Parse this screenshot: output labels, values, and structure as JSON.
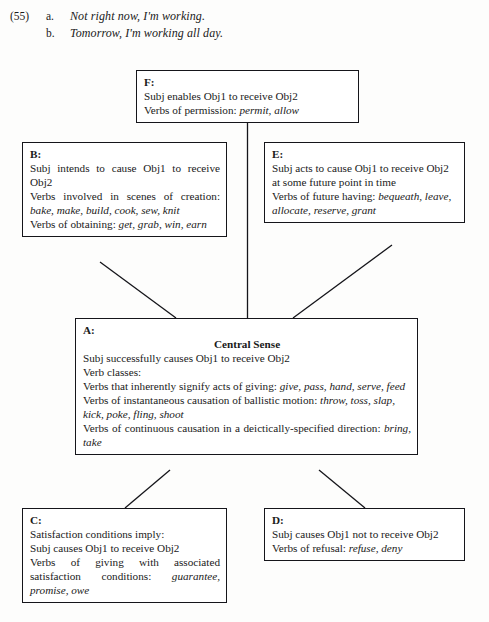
{
  "examples": {
    "number": "(55)",
    "items": [
      {
        "letter": "a.",
        "text": "Not right now, I'm working."
      },
      {
        "letter": "b.",
        "text": "Tomorrow, I'm working all day."
      }
    ]
  },
  "diagram": {
    "colors": {
      "line": "#15151a",
      "box_fill": "#ffffff",
      "page_bg": "#fdfdfc"
    },
    "nodes": {
      "F": {
        "label": "F:",
        "lines": [
          "Subj enables Obj1 to receive Obj2",
          "Verbs of permission: permit, allow"
        ],
        "line1": "Subj enables Obj1 to receive Obj2",
        "line2_pre": "Verbs of permission: ",
        "line2_italic": "permit, allow"
      },
      "B": {
        "label": "B:",
        "line1": "Subj intends to cause Obj1 to receive Obj2",
        "line2_pre": "Verbs involved in scenes of creation: ",
        "line2_italic": "bake, make, build, cook, sew, knit",
        "line3_pre": "Verbs of obtaining: ",
        "line3_italic": "get, grab, win, earn"
      },
      "E": {
        "label": "E:",
        "line1": "Subj acts to cause Obj1 to receive Obj2 at some future point in time",
        "line2_pre": "Verbs of future having: ",
        "line2_italic": "bequeath, leave, allocate, reserve, grant"
      },
      "A": {
        "label": "A:",
        "title": "Central Sense",
        "line1": "Subj successfully causes Obj1 to receive Obj2",
        "line2": "Verb classes:",
        "line3_pre": "Verbs that inherently signify acts of giving: ",
        "line3_italic": "give, pass, hand, serve, feed",
        "line4_pre": "Verbs of instantaneous causation of ballistic motion: ",
        "line4_italic": "throw, toss, slap, kick, poke, fling, shoot",
        "line5_pre": "Verbs of continuous causation in a deictically-specified direction: ",
        "line5_italic": "bring, take"
      },
      "C": {
        "label": "C:",
        "line1": "Satisfaction conditions imply:",
        "line2": "Subj causes Obj1 to receive Obj2",
        "line3_pre": "Verbs of giving with associated satisfaction conditions: ",
        "line3_italic": "guarantee, promise, owe"
      },
      "D": {
        "label": "D:",
        "line1": "Subj causes Obj1 not to receive Obj2",
        "line2_pre": "Verbs of refusal: ",
        "line2_italic": "refuse, deny"
      }
    },
    "edges": [
      {
        "from": "F",
        "to": "A",
        "style": "vertical"
      },
      {
        "from": "B",
        "to": "A",
        "style": "diagonal"
      },
      {
        "from": "E",
        "to": "A",
        "style": "diagonal"
      },
      {
        "from": "A",
        "to": "C",
        "style": "diagonal"
      },
      {
        "from": "A",
        "to": "D",
        "style": "diagonal"
      }
    ]
  }
}
